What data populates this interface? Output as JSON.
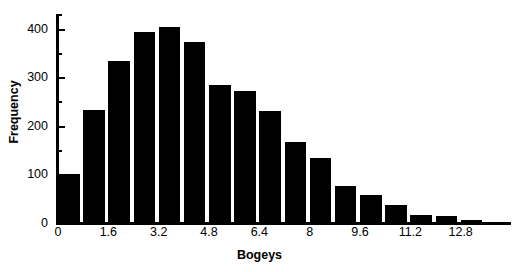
{
  "chart_data": {
    "type": "bar",
    "title": "",
    "subtitle": "",
    "xlabel": "Bogeys",
    "ylabel": "Frequency",
    "grid": false,
    "legend": null,
    "legend_position": "none",
    "bar_color": "#000000",
    "axis_color": "#000000",
    "background": "#ffffff",
    "bin_width": 0.8,
    "xlim": [
      0,
      14.4
    ],
    "ylim": [
      0,
      430
    ],
    "x_tick_labels": [
      "0",
      "1.6",
      "3.2",
      "4.8",
      "6.4",
      "8",
      "9.6",
      "11.2",
      "12.8"
    ],
    "x_tick_values": [
      0,
      1.6,
      3.2,
      4.8,
      6.4,
      8,
      9.6,
      11.2,
      12.8
    ],
    "y_tick_labels": [
      "0",
      "100",
      "200",
      "300",
      "400"
    ],
    "y_tick_values": [
      0,
      100,
      200,
      300,
      400
    ],
    "y_minor_tick_values": [
      50,
      150,
      250,
      350,
      430
    ],
    "bin_left_edges": [
      0,
      0.8,
      1.6,
      2.4,
      3.2,
      4.0,
      4.8,
      5.6,
      6.4,
      7.2,
      8.0,
      8.8,
      9.6,
      10.4,
      11.2,
      12.0,
      12.8,
      13.6
    ],
    "categories": [
      "0-0.8",
      "0.8-1.6",
      "1.6-2.4",
      "2.4-3.2",
      "3.2-4.0",
      "4.0-4.8",
      "4.8-5.6",
      "5.6-6.4",
      "6.4-7.2",
      "7.2-8.0",
      "8.0-8.8",
      "8.8-9.6",
      "9.6-10.4",
      "10.4-11.2",
      "11.2-12.0",
      "12.0-12.8",
      "12.8-13.6",
      "13.6-14.4"
    ],
    "values": [
      100,
      232,
      333,
      394,
      403,
      373,
      283,
      272,
      231,
      167,
      134,
      77,
      58,
      37,
      17,
      14,
      7,
      3
    ]
  }
}
